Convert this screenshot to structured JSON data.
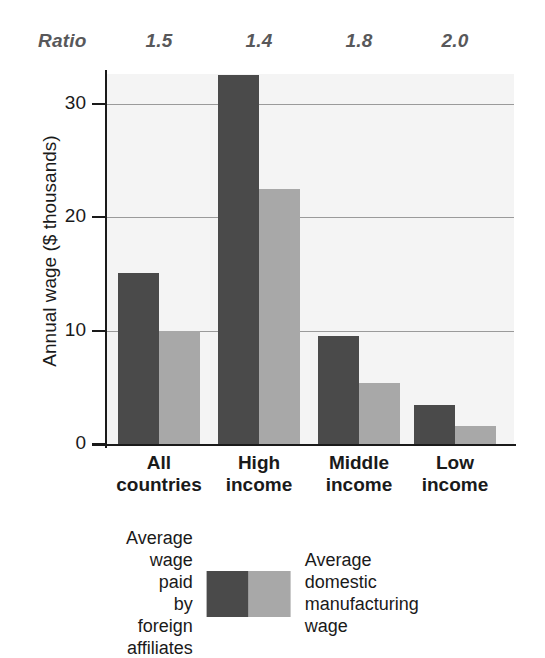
{
  "chart_data": {
    "type": "bar",
    "title": "",
    "xlabel": "",
    "ylabel": "Annual wage ($ thousands)",
    "categories": [
      "All\ncountries",
      "High\nincome",
      "Middle\nincome",
      "Low\nincome"
    ],
    "series": [
      {
        "name": "Average wage paid\nby foreign affiliates",
        "color": "#4a4a4a",
        "values": [
          15.1,
          32.6,
          9.5,
          3.4
        ]
      },
      {
        "name": "Average domestic\nmanufacturing wage",
        "color": "#a8a8a8",
        "values": [
          10.0,
          22.5,
          5.4,
          1.6
        ]
      }
    ],
    "annotation_row": {
      "label": "Ratio",
      "values": [
        "1.5",
        "1.4",
        "1.8",
        "2.0"
      ]
    },
    "ylim": [
      0,
      32.65
    ],
    "yticks": [
      "0",
      "10",
      "20",
      "30"
    ],
    "ytick_values": [
      0,
      10,
      20,
      30
    ],
    "grid": true,
    "legend_position": "bottom"
  },
  "axis": {
    "y_title": "Annual wage ($ thousands)"
  },
  "ratio": {
    "title": "Ratio",
    "v0": "1.5",
    "v1": "1.4",
    "v2": "1.8",
    "v3": "2.0"
  },
  "ticks": {
    "t0": "0",
    "t1": "10",
    "t2": "20",
    "t3": "30"
  },
  "categories": {
    "c0": "All\ncountries",
    "c1": "High\nincome",
    "c2": "Middle\nincome",
    "c3": "Low\nincome"
  },
  "legend": {
    "left_label": "Average wage paid\nby foreign affiliates",
    "right_label": "Average domestic\nmanufacturing wage"
  },
  "colors": {
    "dark": "#4a4a4a",
    "light": "#a8a8a8",
    "plot_background": "#f4f4f4",
    "gridline": "#9a9a9a",
    "axis": "#1a1a1a",
    "ratio_text": "#58585a"
  }
}
